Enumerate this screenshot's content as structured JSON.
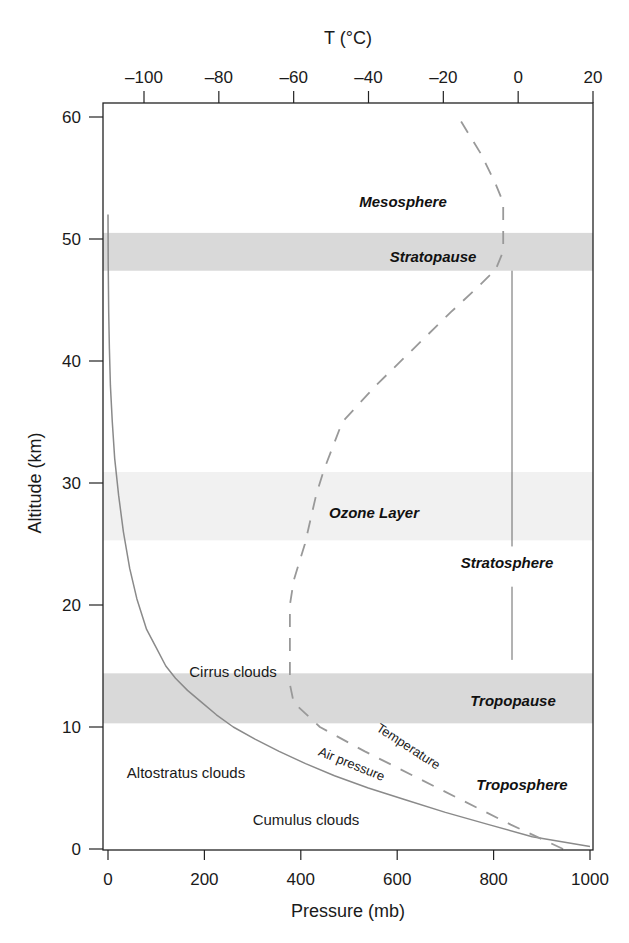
{
  "chart_data": {
    "type": "line",
    "title": "",
    "xlabel": "Pressure (mb)",
    "ylabel": "Altitude (km)",
    "x2label": "T (°C)",
    "xlim": [
      0,
      1000
    ],
    "x2lim": [
      -100,
      20
    ],
    "ylim": [
      0,
      60
    ],
    "x_ticks": [
      0,
      200,
      400,
      600,
      800,
      1000
    ],
    "x2_ticks": [
      -100,
      -80,
      -60,
      -40,
      -20,
      0,
      20
    ],
    "y_ticks": [
      0,
      10,
      20,
      30,
      40,
      50,
      60
    ],
    "x_tick_labels": [
      "0",
      "200",
      "400",
      "600",
      "800",
      "1000"
    ],
    "x2_tick_labels": [
      "–100",
      "–80",
      "–60",
      "–40",
      "–20",
      "0",
      "20"
    ],
    "y_tick_labels": [
      "0",
      "10",
      "20",
      "30",
      "40",
      "50",
      "60"
    ],
    "grid": false,
    "series": [
      {
        "name": "Air pressure",
        "axis": "bottom",
        "style": "solid",
        "color": "#8a8a8a",
        "points": [
          [
            1000,
            0.2
          ],
          [
            880,
            1
          ],
          [
            790,
            2
          ],
          [
            700,
            3
          ],
          [
            620,
            4
          ],
          [
            540,
            5
          ],
          [
            470,
            6
          ],
          [
            410,
            7
          ],
          [
            355,
            8
          ],
          [
            305,
            9
          ],
          [
            260,
            10
          ],
          [
            225,
            11
          ],
          [
            195,
            12
          ],
          [
            165,
            13
          ],
          [
            140,
            14
          ],
          [
            120,
            15
          ],
          [
            100,
            16.5
          ],
          [
            80,
            18
          ],
          [
            60,
            20.5
          ],
          [
            45,
            23
          ],
          [
            32,
            26
          ],
          [
            22,
            29
          ],
          [
            14,
            32
          ],
          [
            9,
            35
          ],
          [
            5,
            38
          ],
          [
            3,
            41
          ],
          [
            1.5,
            44
          ],
          [
            0.5,
            48
          ],
          [
            0,
            52
          ]
        ]
      },
      {
        "name": "Temperature",
        "axis": "top",
        "style": "dashed",
        "color": "#999999",
        "points": [
          [
            12,
            0
          ],
          [
            -2,
            2
          ],
          [
            -15,
            4
          ],
          [
            -28,
            6
          ],
          [
            -41,
            8
          ],
          [
            -53,
            10
          ],
          [
            -60,
            12
          ],
          [
            -61,
            13.5
          ],
          [
            -61,
            16
          ],
          [
            -61,
            20
          ],
          [
            -60,
            22
          ],
          [
            -57,
            25
          ],
          [
            -54,
            29
          ],
          [
            -52,
            31
          ],
          [
            -47,
            35
          ],
          [
            -38,
            38
          ],
          [
            -28,
            41
          ],
          [
            -18,
            44
          ],
          [
            -11,
            46
          ],
          [
            -6,
            47.5
          ],
          [
            -4,
            49
          ],
          [
            -4,
            51
          ],
          [
            -4,
            53
          ],
          [
            -6,
            54.5
          ],
          [
            -10,
            57
          ],
          [
            -16,
            60
          ]
        ]
      }
    ],
    "bands": [
      {
        "name": "Tropopause",
        "from": 10.3,
        "to": 14.4,
        "color": "#d9d9d9"
      },
      {
        "name": "Ozone Layer",
        "from": 25.3,
        "to": 30.9,
        "color": "#f1f1f1"
      },
      {
        "name": "Stratopause",
        "from": 47.4,
        "to": 50.5,
        "color": "#d9d9d9"
      }
    ],
    "stratosphere_marker": {
      "x_pressure": 835,
      "from": 15.5,
      "to": 47.4,
      "gap_from": 21.5,
      "gap_to": 24.8
    },
    "annotations": {
      "mesosphere": "Mesosphere",
      "stratopause": "Stratopause",
      "ozone_layer": "Ozone Layer",
      "stratosphere": "Stratosphere",
      "tropopause": "Tropopause",
      "troposphere": "Troposphere",
      "cirrus": "Cirrus clouds",
      "altostratus": "Altostratus clouds",
      "cumulus": "Cumulus clouds",
      "temperature": "Temperature",
      "air_pressure": "Air pressure"
    }
  }
}
